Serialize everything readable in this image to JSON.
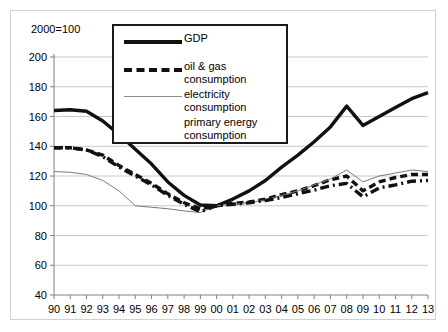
{
  "chart_data": {
    "type": "line",
    "title": "",
    "subtitle": "",
    "unit_note": "2000=100",
    "xlabel": "",
    "ylabel": "",
    "ylim": [
      40,
      200
    ],
    "ytick_step": 20,
    "yticks": [
      200,
      180,
      160,
      140,
      120,
      100,
      80,
      60,
      40
    ],
    "grid": true,
    "legend_position": "top-center",
    "categories": [
      "90",
      "91",
      "92",
      "93",
      "94",
      "95",
      "96",
      "97",
      "98",
      "99",
      "00",
      "01",
      "02",
      "03",
      "04",
      "05",
      "06",
      "07",
      "08",
      "09",
      "10",
      "11",
      "12",
      "13"
    ],
    "series": [
      {
        "name": "GDP",
        "style": "solid-thick",
        "color": "#111111",
        "values": [
          164,
          164.5,
          163.5,
          157,
          148,
          138,
          128,
          116,
          107,
          100.5,
          100,
          104.5,
          110,
          117,
          126,
          134,
          143,
          153,
          167,
          154,
          160,
          166,
          172,
          176
        ]
      },
      {
        "name": "oil & gas consumption",
        "style": "dashed-thick",
        "color": "#111111",
        "values": [
          139,
          139,
          137.5,
          134,
          127,
          121,
          115,
          108,
          102,
          98,
          100,
          101.5,
          102.5,
          104.5,
          107.5,
          110,
          113.5,
          117.5,
          120,
          110,
          116,
          119,
          121,
          121
        ]
      },
      {
        "name": "electricity consumption",
        "style": "solid-thin",
        "color": "#7a7a7a",
        "values": [
          123,
          122.5,
          121,
          117,
          110,
          100,
          99,
          98,
          96.5,
          95.5,
          100,
          101,
          102,
          104,
          107,
          110,
          114,
          118,
          124,
          116,
          120,
          122,
          124,
          123
        ]
      },
      {
        "name": "primary energy consumption",
        "style": "dashdot-thick",
        "color": "#111111",
        "values": [
          139,
          139,
          137.5,
          133,
          126,
          120,
          114,
          107,
          101,
          96,
          100,
          101,
          102,
          103.5,
          105.5,
          108,
          110.5,
          113.5,
          115,
          106,
          112,
          114,
          116.5,
          117
        ]
      }
    ]
  },
  "legend": {
    "items": [
      {
        "label": "GDP",
        "label2": "",
        "swatch": "solid-thick-swatch"
      },
      {
        "label": "oil & gas",
        "label2": "consumption",
        "swatch": "dashed-thick-swatch"
      },
      {
        "label": "electricity",
        "label2": "consumption",
        "swatch": "solid-thin-swatch"
      },
      {
        "label": "primary energy",
        "label2": "consumption",
        "swatch": "dashdot-thick-swatch"
      }
    ]
  }
}
